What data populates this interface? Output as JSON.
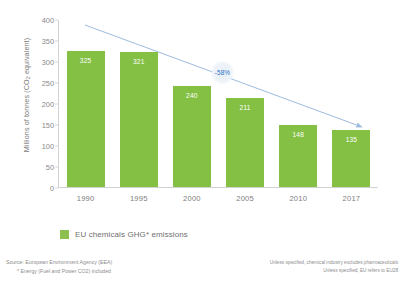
{
  "chart_data": {
    "type": "bar",
    "title": "",
    "categories": [
      "1990",
      "1995",
      "2000",
      "2005",
      "2010",
      "2017"
    ],
    "values": [
      325,
      321,
      240,
      211,
      148,
      135
    ],
    "series": [
      {
        "name": "EU chemicals GHG* emissions",
        "values": [
          325,
          321,
          240,
          211,
          148,
          135
        ]
      }
    ],
    "xlabel": "",
    "ylabel": "Millions of tonnes (CO2 equivalent)",
    "ylim": [
      0,
      400
    ],
    "yticks": [
      0,
      50,
      100,
      150,
      200,
      250,
      300,
      350,
      400
    ],
    "ytick_labels": [
      "0",
      "50",
      "100",
      "150",
      "200",
      "250",
      "300",
      "350",
      "400"
    ],
    "grid": false,
    "legend_position": "bottom",
    "bar_color": "#84c044",
    "annotations": [
      {
        "text": "-58%",
        "kind": "trend-arrow-label",
        "from": "1990",
        "to": "2017",
        "color": "#2f6fbe"
      }
    ]
  },
  "axis": {
    "y_title_main": "Millions of tonnes (CO",
    "y_title_sub": "2",
    "y_title_tail": " equivalent)"
  },
  "legend": {
    "label": "EU chemicals GHG* emissions",
    "swatch_color": "#8cc152"
  },
  "annotation": {
    "reduction_badge": "-58%"
  },
  "footer": {
    "source_line1": "Source: European Environment Agency (EEA)",
    "source_line2": "* Energy (Fuel and Power CO2) included",
    "note_line1": "Unless specified, chemical industry excludes pharmaceuticals",
    "note_line2": "Unless specified, EU refers to EU28"
  }
}
